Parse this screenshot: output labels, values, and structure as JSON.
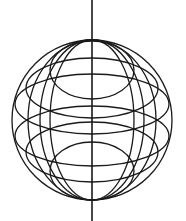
{
  "figure": {
    "type": "wireframe-sphere",
    "width": 186,
    "height": 221,
    "background": "#ffffff",
    "stroke_color": "#1a1a1a",
    "stroke_width": 1.3,
    "axis": {
      "x": 92,
      "y1": 0,
      "y2": 221,
      "stroke_width": 1.6
    },
    "outline": {
      "cx": 92,
      "cy": 120,
      "rx": 80,
      "ry": 80
    },
    "meridians": [
      {
        "cx": 92,
        "cy": 120,
        "rx": 64,
        "ry": 80
      },
      {
        "cx": 92,
        "cy": 120,
        "rx": 52,
        "ry": 80
      },
      {
        "cx": 92,
        "cy": 120,
        "rx": 42,
        "ry": 80
      }
    ],
    "parallels": [
      {
        "cx": 92,
        "cy": 70,
        "rx": 42,
        "ry": 29
      },
      {
        "cx": 92,
        "cy": 88,
        "rx": 66,
        "ry": 30
      },
      {
        "cx": 92,
        "cy": 104,
        "rx": 77,
        "ry": 30
      },
      {
        "cx": 92,
        "cy": 136,
        "rx": 77,
        "ry": 30
      },
      {
        "cx": 92,
        "cy": 152,
        "rx": 66,
        "ry": 30
      },
      {
        "cx": 92,
        "cy": 171,
        "rx": 42,
        "ry": 29
      }
    ]
  }
}
